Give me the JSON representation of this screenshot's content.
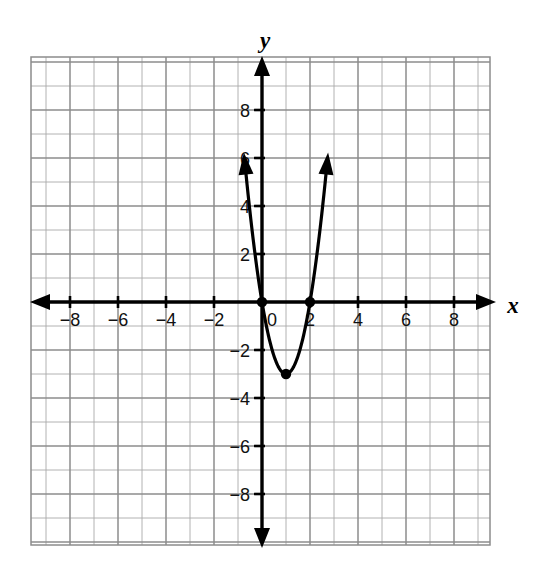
{
  "figure": {
    "kind": "coordinate-plane-graph",
    "background_color": "#ffffff",
    "grid_color": "#9a9a9a",
    "grid_color_major": "#8a8a8a",
    "axis_color": "#000000",
    "curve_color": "#000000",
    "x_axis_label": "x",
    "y_axis_label": "y"
  },
  "chart_data": {
    "type": "line",
    "title": "",
    "subtitle": "",
    "xlabel": "x",
    "ylabel": "y",
    "grid": true,
    "legend": "none",
    "xlim": [
      -9.6,
      9.5
    ],
    "ylim": [
      -10.1,
      10.2
    ],
    "x_ticks": [
      -8,
      -6,
      -4,
      -2,
      0,
      2,
      4,
      6,
      8
    ],
    "x_tick_labels": [
      "-8",
      "-6",
      "-4",
      "-2",
      "0",
      "2",
      "4",
      "6",
      "8"
    ],
    "y_ticks": [
      -8,
      -6,
      -4,
      -2,
      2,
      4,
      6,
      8
    ],
    "y_tick_labels": [
      "-8",
      "-6",
      "-4",
      "-2",
      "2",
      "4",
      "6",
      "8"
    ],
    "grid_step": 1,
    "major_grid_step": 2,
    "series": [
      {
        "name": "parabola",
        "equation": "y = 3x^2 - 6x",
        "a": 3,
        "b": -6,
        "c": 0,
        "vertex": [
          1,
          -3
        ],
        "roots": [
          0,
          2
        ],
        "x_domain": [
          -0.73,
          2.73
        ],
        "points": [
          [
            -0.73,
            9.98
          ],
          [
            -0.6,
            10.68
          ],
          [
            -0.4,
            8.88
          ],
          [
            -0.2,
            7.32
          ],
          [
            0,
            0
          ],
          [
            0.2,
            -1.08
          ],
          [
            0.4,
            -1.92
          ],
          [
            0.6,
            -2.52
          ],
          [
            0.8,
            -2.88
          ],
          [
            1,
            -3
          ],
          [
            1.2,
            -2.88
          ],
          [
            1.4,
            -2.52
          ],
          [
            1.6,
            -1.92
          ],
          [
            1.8,
            -1.08
          ],
          [
            2,
            0
          ],
          [
            2.2,
            1.32
          ],
          [
            2.4,
            2.88
          ],
          [
            2.6,
            4.68
          ],
          [
            2.73,
            9.98
          ]
        ],
        "arrow_ends": [
          "top-left",
          "top-right"
        ],
        "marked_points": [
          {
            "label": "",
            "x": 0,
            "y": 0
          },
          {
            "label": "",
            "x": 2,
            "y": 0
          },
          {
            "label": "",
            "x": 1,
            "y": -3
          }
        ]
      }
    ]
  },
  "axis_arrows": {
    "x_left": true,
    "x_right": true,
    "y_up": true,
    "y_down": true
  }
}
